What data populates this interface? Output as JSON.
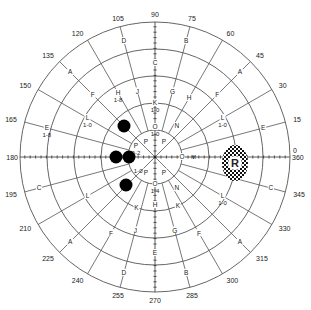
{
  "chart_data": {
    "type": "polar-perimetry",
    "title": "",
    "center": [
      155,
      157
    ],
    "rings_radius_px": [
      27,
      54,
      81,
      108,
      135
    ],
    "meridian_step_deg": 15,
    "degree_labels": [
      "0",
      "15",
      "30",
      "45",
      "60",
      "75",
      "90",
      "105",
      "120",
      "135",
      "150",
      "165",
      "180",
      "195",
      "210",
      "225",
      "240",
      "255",
      "270",
      "285",
      "300",
      "315",
      "330",
      "345",
      "360"
    ],
    "isopter_labels": [
      {
        "angle": 105,
        "r": 120,
        "text": "D"
      },
      {
        "angle": 75,
        "r": 120,
        "text": "B"
      },
      {
        "angle": 135,
        "r": 120,
        "text": "A"
      },
      {
        "angle": 45,
        "r": 120,
        "text": "A"
      },
      {
        "angle": 90,
        "r": 94,
        "text": "C"
      },
      {
        "angle": 105,
        "r": 68,
        "text": "J"
      },
      {
        "angle": 75,
        "r": 68,
        "text": "G"
      },
      {
        "angle": 120,
        "r": 74,
        "text": "H",
        "sub": "1-8"
      },
      {
        "angle": 60,
        "r": 68,
        "text": "H"
      },
      {
        "angle": 135,
        "r": 88,
        "text": "F"
      },
      {
        "angle": 45,
        "r": 88,
        "text": "F"
      },
      {
        "angle": 150,
        "r": 78,
        "text": "L",
        "sub": "1-0"
      },
      {
        "angle": 30,
        "r": 78,
        "text": "L",
        "sub": "1-0"
      },
      {
        "angle": 165,
        "r": 112,
        "text": "E",
        "sub": "1-8"
      },
      {
        "angle": 15,
        "r": 112,
        "text": "E"
      },
      {
        "angle": 90,
        "r": 30,
        "text": "O",
        "sub": "1-0"
      },
      {
        "angle": 90,
        "r": 54,
        "text": "K",
        "sub": "1-0"
      },
      {
        "angle": 55,
        "r": 38,
        "text": "N"
      },
      {
        "angle": 305,
        "r": 38,
        "text": "N"
      },
      {
        "angle": 0,
        "r": 27,
        "text": "O",
        "sub_right": "M"
      },
      {
        "angle": 195,
        "r": 120,
        "text": "C"
      },
      {
        "angle": 345,
        "r": 120,
        "text": "C"
      },
      {
        "angle": 210,
        "r": 78,
        "text": "L"
      },
      {
        "angle": 330,
        "r": 78,
        "text": "L",
        "sub": "1-0"
      },
      {
        "angle": 225,
        "r": 120,
        "text": "A"
      },
      {
        "angle": 315,
        "r": 120,
        "text": "A"
      },
      {
        "angle": 240,
        "r": 88,
        "text": "F"
      },
      {
        "angle": 300,
        "r": 88,
        "text": "F"
      },
      {
        "angle": 250,
        "r": 54,
        "text": "K"
      },
      {
        "angle": 295,
        "r": 54,
        "text": "K"
      },
      {
        "angle": 255,
        "r": 76,
        "text": "J"
      },
      {
        "angle": 285,
        "r": 76,
        "text": "G"
      },
      {
        "angle": 255,
        "r": 120,
        "text": "D"
      },
      {
        "angle": 285,
        "r": 120,
        "text": "B"
      },
      {
        "angle": 270,
        "r": 27,
        "text": "O",
        "sub": "1-4"
      },
      {
        "angle": 270,
        "r": 48,
        "text": "H"
      },
      {
        "angle": 270,
        "r": 96,
        "text": "E"
      },
      {
        "angle": 120,
        "r": 18,
        "text": "P"
      },
      {
        "angle": 60,
        "r": 18,
        "text": "P"
      },
      {
        "angle": 240,
        "r": 18,
        "text": "P"
      },
      {
        "angle": 300,
        "r": 18,
        "text": "P"
      },
      {
        "angle": 150,
        "r": 22,
        "text": "P",
        "sub": "0-2"
      },
      {
        "angle": 220,
        "r": 22,
        "text": "",
        "sub": "1-0"
      }
    ],
    "scotomas": [
      {
        "cx": 124,
        "cy": 126,
        "r": 6.5
      },
      {
        "cx": 116,
        "cy": 157,
        "r": 6.5
      },
      {
        "cx": 129,
        "cy": 157,
        "r": 6.5
      },
      {
        "cx": 126,
        "cy": 185,
        "r": 6.5
      }
    ],
    "blind_spot": {
      "cx": 235,
      "cy": 163,
      "rx": 13,
      "ry": 18,
      "label": "R"
    }
  }
}
